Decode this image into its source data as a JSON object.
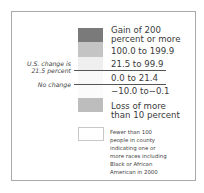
{
  "legend": {
    "items": [
      {
        "label_line1": "Gain of 200",
        "label_line2": "percent or more",
        "color": "#7a7a7a"
      },
      {
        "label": "100.0 to 199.9",
        "color": "#c4c4c4"
      },
      {
        "label": "21.5 to 99.9",
        "color": "#efefef"
      },
      {
        "label": "0.0 to 21.4",
        "color": "#f9f9f9"
      },
      {
        "label": "−10.0 to−0.1",
        "color": "#fbfbfb"
      },
      {
        "label_line1": "Loss of more",
        "label_line2": "than 10 percent",
        "color": "#bdbdbd"
      }
    ],
    "notes": {
      "us_change_line1": "U.S. change is",
      "us_change_line2": "21.5 percent",
      "no_change": "No change"
    },
    "no_data": {
      "lines": [
        "Fewer than 100",
        "people in county",
        "indicating one or",
        "more races including",
        "Black or African",
        "American in 2000"
      ]
    }
  }
}
